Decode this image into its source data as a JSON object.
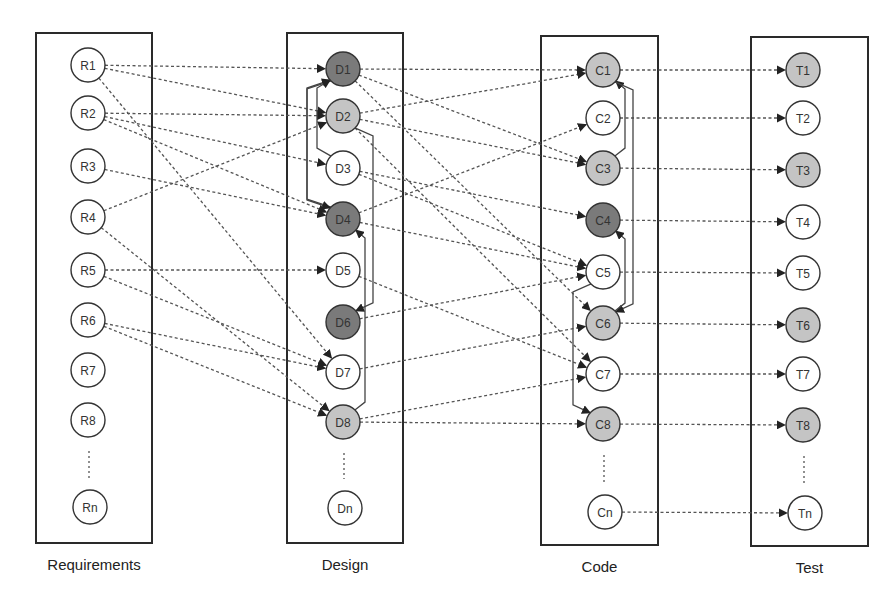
{
  "columns": [
    {
      "id": "R",
      "title": "Requirements",
      "box": [
        36,
        33,
        116,
        510
      ],
      "x": 88,
      "nodes": [
        {
          "label": "R1",
          "y": 65,
          "shade": "white"
        },
        {
          "label": "R2",
          "y": 113,
          "shade": "white"
        },
        {
          "label": "R3",
          "y": 166,
          "shade": "white"
        },
        {
          "label": "R4",
          "y": 217,
          "shade": "white"
        },
        {
          "label": "R5",
          "y": 270,
          "shade": "white"
        },
        {
          "label": "R6",
          "y": 320,
          "shade": "white"
        },
        {
          "label": "R7",
          "y": 370,
          "shade": "white"
        },
        {
          "label": "R8",
          "y": 420,
          "shade": "white"
        },
        {
          "label": "Rn",
          "y": 507,
          "shade": "white"
        }
      ]
    },
    {
      "id": "D",
      "title": "Design",
      "box": [
        287,
        33,
        116,
        510
      ],
      "x": 343,
      "nodes": [
        {
          "label": "D1",
          "y": 69,
          "shade": "dark"
        },
        {
          "label": "D2",
          "y": 116,
          "shade": "light"
        },
        {
          "label": "D3",
          "y": 168,
          "shade": "white"
        },
        {
          "label": "D4",
          "y": 219,
          "shade": "dark"
        },
        {
          "label": "D5",
          "y": 270,
          "shade": "white"
        },
        {
          "label": "D6",
          "y": 322,
          "shade": "dark"
        },
        {
          "label": "D7",
          "y": 372,
          "shade": "white"
        },
        {
          "label": "D8",
          "y": 422,
          "shade": "light"
        },
        {
          "label": "Dn",
          "y": 508,
          "shade": "white"
        }
      ]
    },
    {
      "id": "C",
      "title": "Code",
      "box": [
        541,
        36,
        117,
        509
      ],
      "x": 603,
      "nodes": [
        {
          "label": "C1",
          "y": 70,
          "shade": "light"
        },
        {
          "label": "C2",
          "y": 118,
          "shade": "white"
        },
        {
          "label": "C3",
          "y": 168,
          "shade": "light"
        },
        {
          "label": "C4",
          "y": 220,
          "shade": "dark"
        },
        {
          "label": "C5",
          "y": 272,
          "shade": "white"
        },
        {
          "label": "C6",
          "y": 323,
          "shade": "light"
        },
        {
          "label": "C7",
          "y": 374,
          "shade": "white"
        },
        {
          "label": "C8",
          "y": 424,
          "shade": "light"
        },
        {
          "label": "Cn",
          "y": 512,
          "shade": "white"
        }
      ]
    },
    {
      "id": "T",
      "title": "Test",
      "box": [
        751,
        37,
        117,
        509
      ],
      "x": 803,
      "nodes": [
        {
          "label": "T1",
          "y": 70,
          "shade": "light"
        },
        {
          "label": "T2",
          "y": 118,
          "shade": "white"
        },
        {
          "label": "T3",
          "y": 170,
          "shade": "light"
        },
        {
          "label": "T4",
          "y": 222,
          "shade": "white"
        },
        {
          "label": "T5",
          "y": 273,
          "shade": "white"
        },
        {
          "label": "T6",
          "y": 325,
          "shade": "light"
        },
        {
          "label": "T7",
          "y": 374,
          "shade": "white"
        },
        {
          "label": "T8",
          "y": 425,
          "shade": "light"
        },
        {
          "label": "Tn",
          "y": 513,
          "shade": "white"
        }
      ]
    }
  ],
  "trace_links": [
    [
      "R1",
      "D1"
    ],
    [
      "R1",
      "D2"
    ],
    [
      "R1",
      "D7"
    ],
    [
      "R2",
      "D2"
    ],
    [
      "R2",
      "D3"
    ],
    [
      "R2",
      "D4"
    ],
    [
      "R3",
      "D4"
    ],
    [
      "R4",
      "D2"
    ],
    [
      "R4",
      "D8"
    ],
    [
      "R5",
      "D5"
    ],
    [
      "R5",
      "D7"
    ],
    [
      "R6",
      "D7"
    ],
    [
      "R6",
      "D8"
    ],
    [
      "D1",
      "C1"
    ],
    [
      "D1",
      "C3"
    ],
    [
      "D1",
      "C6"
    ],
    [
      "D2",
      "C1"
    ],
    [
      "D2",
      "C3"
    ],
    [
      "D2",
      "C7"
    ],
    [
      "D3",
      "C4"
    ],
    [
      "D3",
      "C5"
    ],
    [
      "D4",
      "C2"
    ],
    [
      "D4",
      "C5"
    ],
    [
      "D5",
      "C7"
    ],
    [
      "D6",
      "C5"
    ],
    [
      "D7",
      "C6"
    ],
    [
      "D8",
      "C7"
    ],
    [
      "D8",
      "C8"
    ],
    [
      "C1",
      "T1"
    ],
    [
      "C2",
      "T2"
    ],
    [
      "C3",
      "T3"
    ],
    [
      "C4",
      "T4"
    ],
    [
      "C5",
      "T5"
    ],
    [
      "C6",
      "T6"
    ],
    [
      "C7",
      "T7"
    ],
    [
      "C8",
      "T8"
    ],
    [
      "Cn",
      "Tn"
    ]
  ],
  "dependency_links": [
    {
      "from": "D4",
      "to": "D1",
      "side": "left-outer"
    },
    {
      "from": "D1",
      "to": "D4",
      "side": "left-outer"
    },
    {
      "from": "D3",
      "to": "D1",
      "side": "left-inner"
    },
    {
      "from": "D2",
      "to": "D6",
      "side": "right-outer"
    },
    {
      "from": "D8",
      "to": "D4",
      "side": "right-inner"
    },
    {
      "from": "C3",
      "to": "C1",
      "side": "right-inner"
    },
    {
      "from": "C1",
      "to": "C6",
      "side": "right-outer"
    },
    {
      "from": "C6",
      "to": "C4",
      "side": "right-inner"
    },
    {
      "from": "C5",
      "to": "C8",
      "side": "left"
    }
  ],
  "legend": {
    "shades": {
      "white": "#ffffff",
      "light": "#c4c4c4",
      "dark": "#7a7a7a"
    }
  }
}
